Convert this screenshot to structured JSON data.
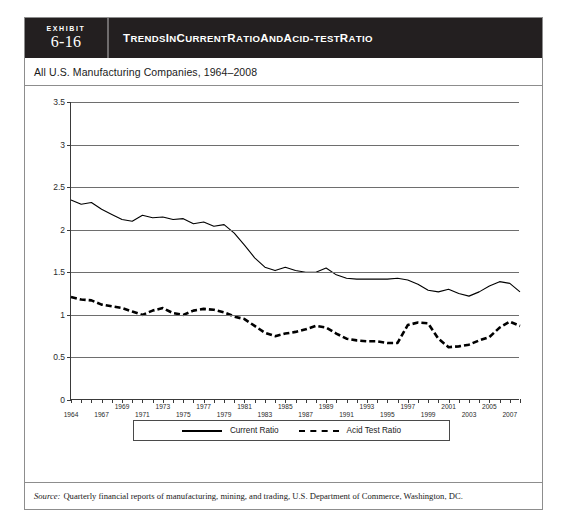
{
  "exhibit": {
    "tag_word": "Exhibit",
    "number": "6-16",
    "title_main": "TRENDS IN CURRENT RATIO AND ACID-TEST RATIO",
    "subtitle": "All U.S. Manufacturing Companies, 1964–2008",
    "source_label": "Source:",
    "source_text": "Quarterly financial reports of manufacturing, mining, and trading, U.S. Department of Commerce, Washington, DC."
  },
  "legend": {
    "current_ratio": "Current Ratio",
    "acid_test_ratio": "Acid Test Ratio"
  },
  "chart_data": {
    "type": "line",
    "title": "Trends in Current Ratio and Acid-Test Ratio",
    "subtitle": "All U.S. Manufacturing Companies, 1964–2008",
    "xlabel": "",
    "ylabel": "",
    "xlim": [
      1964,
      2008
    ],
    "ylim": [
      0,
      3.5
    ],
    "yticks": [
      0,
      0.5,
      1,
      1.5,
      2,
      2.5,
      3,
      3.5
    ],
    "ytick_labels": [
      "0",
      "0.5",
      "1",
      "1.5",
      "2",
      "2.5",
      "3",
      "3.5"
    ],
    "grid": true,
    "legend_position": "bottom",
    "xticks": [
      1964,
      1965,
      1966,
      1967,
      1968,
      1969,
      1970,
      1971,
      1972,
      1973,
      1974,
      1975,
      1976,
      1977,
      1978,
      1979,
      1980,
      1981,
      1982,
      1983,
      1984,
      1985,
      1986,
      1987,
      1988,
      1989,
      1990,
      1991,
      1992,
      1993,
      1994,
      1995,
      1996,
      1997,
      1998,
      1999,
      2000,
      2001,
      2002,
      2003,
      2004,
      2005,
      2006,
      2007,
      2008
    ],
    "xtick_labels": [
      {
        "year": 1964,
        "label": "1964",
        "row": "lo"
      },
      {
        "year": 1967,
        "label": "1967",
        "row": "lo"
      },
      {
        "year": 1969,
        "label": "1969",
        "row": "hi"
      },
      {
        "year": 1971,
        "label": "1971",
        "row": "lo"
      },
      {
        "year": 1973,
        "label": "1973",
        "row": "hi"
      },
      {
        "year": 1975,
        "label": "1975",
        "row": "lo"
      },
      {
        "year": 1977,
        "label": "1977",
        "row": "hi"
      },
      {
        "year": 1979,
        "label": "1979",
        "row": "lo"
      },
      {
        "year": 1981,
        "label": "1981",
        "row": "hi"
      },
      {
        "year": 1983,
        "label": "1983",
        "row": "lo"
      },
      {
        "year": 1985,
        "label": "1985",
        "row": "hi"
      },
      {
        "year": 1987,
        "label": "1987",
        "row": "lo"
      },
      {
        "year": 1989,
        "label": "1989",
        "row": "hi"
      },
      {
        "year": 1991,
        "label": "1991",
        "row": "lo"
      },
      {
        "year": 1993,
        "label": "1993",
        "row": "hi"
      },
      {
        "year": 1995,
        "label": "1995",
        "row": "lo"
      },
      {
        "year": 1997,
        "label": "1997",
        "row": "hi"
      },
      {
        "year": 1999,
        "label": "1999",
        "row": "lo"
      },
      {
        "year": 2001,
        "label": "2001",
        "row": "hi"
      },
      {
        "year": 2003,
        "label": "2003",
        "row": "lo"
      },
      {
        "year": 2005,
        "label": "2005",
        "row": "hi"
      },
      {
        "year": 2007,
        "label": "2007",
        "row": "lo"
      }
    ],
    "x": [
      1964,
      1965,
      1966,
      1967,
      1968,
      1969,
      1970,
      1971,
      1972,
      1973,
      1974,
      1975,
      1976,
      1977,
      1978,
      1979,
      1980,
      1981,
      1982,
      1983,
      1984,
      1985,
      1986,
      1987,
      1988,
      1989,
      1990,
      1991,
      1992,
      1993,
      1994,
      1995,
      1996,
      1997,
      1998,
      1999,
      2000,
      2001,
      2002,
      2003,
      2004,
      2005,
      2006,
      2007,
      2008
    ],
    "series": [
      {
        "name": "Current Ratio",
        "style": "solid",
        "color": "#000000",
        "values": [
          2.35,
          2.3,
          2.32,
          2.24,
          2.18,
          2.12,
          2.1,
          2.17,
          2.14,
          2.15,
          2.12,
          2.13,
          2.07,
          2.09,
          2.04,
          2.06,
          1.96,
          1.82,
          1.67,
          1.56,
          1.52,
          1.56,
          1.52,
          1.5,
          1.5,
          1.55,
          1.47,
          1.43,
          1.42,
          1.42,
          1.42,
          1.42,
          1.43,
          1.41,
          1.36,
          1.29,
          1.27,
          1.3,
          1.25,
          1.22,
          1.27,
          1.34,
          1.39,
          1.37,
          1.27
        ]
      },
      {
        "name": "Acid Test Ratio",
        "style": "dashed",
        "color": "#000000",
        "values": [
          1.21,
          1.18,
          1.17,
          1.12,
          1.1,
          1.08,
          1.04,
          1.0,
          1.05,
          1.08,
          1.02,
          1.0,
          1.05,
          1.07,
          1.06,
          1.03,
          0.98,
          0.95,
          0.87,
          0.79,
          0.75,
          0.78,
          0.8,
          0.83,
          0.87,
          0.85,
          0.78,
          0.72,
          0.7,
          0.69,
          0.69,
          0.67,
          0.67,
          0.88,
          0.91,
          0.9,
          0.72,
          0.62,
          0.63,
          0.65,
          0.7,
          0.74,
          0.85,
          0.92,
          0.87
        ]
      }
    ]
  }
}
